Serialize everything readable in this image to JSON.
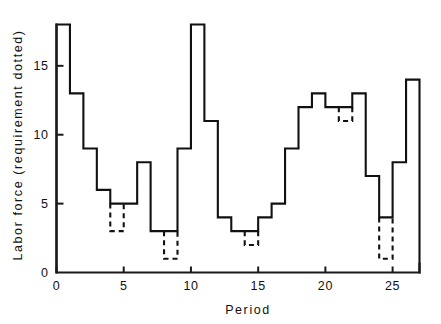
{
  "chart_data": {
    "type": "line",
    "subtype": "step",
    "title": "",
    "xlabel": "Period",
    "ylabel": "Labor force (requirement dotted)",
    "xlim": [
      0,
      27
    ],
    "ylim": [
      0,
      18
    ],
    "grid": false,
    "legend": "none",
    "x_ticks": [
      0,
      5,
      10,
      15,
      20,
      25
    ],
    "x_tick_labels": [
      "0",
      "5",
      "10",
      "15",
      "20",
      "25"
    ],
    "y_ticks": [
      0,
      5,
      10,
      15
    ],
    "y_tick_labels": [
      "0",
      "5",
      "10",
      "15"
    ],
    "categories": [
      "0-1",
      "1-2",
      "2-3",
      "3-4",
      "4-5",
      "5-6",
      "6-7",
      "7-8",
      "8-9",
      "9-10",
      "10-11",
      "11-12",
      "12-13",
      "13-14",
      "14-15",
      "15-16",
      "16-17",
      "17-18",
      "18-19",
      "19-20",
      "20-21",
      "21-22",
      "22-23",
      "23-24",
      "24-25",
      "25-26",
      "26-27"
    ],
    "series": [
      {
        "name": "Labor force",
        "style": "solid",
        "values": [
          18,
          13,
          9,
          6,
          5,
          5,
          8,
          3,
          3,
          9,
          18,
          11,
          4,
          3,
          3,
          4,
          5,
          9,
          12,
          13,
          12,
          12,
          13,
          7,
          4,
          8,
          14
        ]
      },
      {
        "name": "Requirement",
        "style": "dotted",
        "note": "drawn only where the requirement falls below the labor force",
        "values": [
          18,
          13,
          9,
          6,
          3,
          5,
          8,
          3,
          1,
          9,
          18,
          11,
          4,
          3,
          2,
          4,
          5,
          9,
          12,
          13,
          12,
          11,
          13,
          7,
          1,
          8,
          14
        ],
        "dips": [
          {
            "period_start": 4,
            "period_end": 5,
            "from": 5,
            "to": 3
          },
          {
            "period_start": 8,
            "period_end": 9,
            "from": 3,
            "to": 1
          },
          {
            "period_start": 14,
            "period_end": 15,
            "from": 3,
            "to": 2
          },
          {
            "period_start": 21,
            "period_end": 22,
            "from": 12,
            "to": 11
          },
          {
            "period_start": 24,
            "period_end": 25,
            "from": 4,
            "to": 1
          }
        ]
      }
    ]
  },
  "axes": {
    "x_title": "Period",
    "y_title": "Labor force (requirement dotted)"
  },
  "colors": {
    "ink": "#111111",
    "background": "#ffffff"
  }
}
